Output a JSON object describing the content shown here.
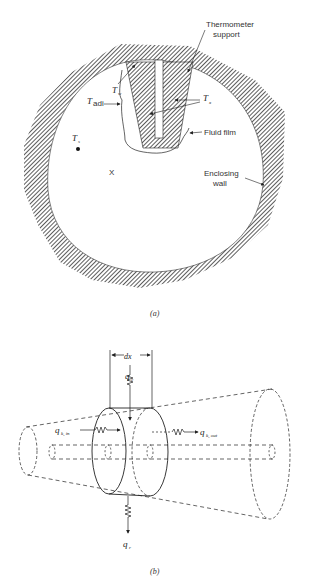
{
  "figure_a": {
    "labels": {
      "thermometer_support_line1": "Thermometer",
      "thermometer_support_line2": "support",
      "t_w": "T",
      "t_w_sub": "w",
      "t_adi": "T",
      "t_adi_sub": "adi",
      "t_x": "T",
      "t_x_sub": "x",
      "t_s": "T",
      "t_s_sub": "s",
      "x_mark": "X",
      "fluid_film": "Fluid film",
      "enclosing_wall_line1": "Enclosing",
      "enclosing_wall_line2": "wall"
    },
    "caption": "(a)"
  },
  "figure_b": {
    "labels": {
      "dx": "dx",
      "q_c": "q",
      "q_c_sub": "c",
      "q_k_in": "q",
      "q_k_in_sub": "k, in",
      "q_k_out": "q",
      "q_k_out_sub": "k, out",
      "q_r": "q",
      "q_r_sub": "r"
    },
    "caption": "(b)"
  },
  "colors": {
    "ink": "#222222",
    "hatch": "#333333",
    "background": "#ffffff"
  }
}
